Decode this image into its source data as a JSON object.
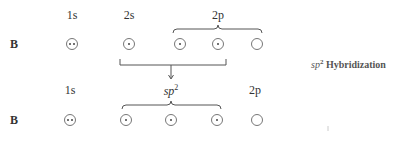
{
  "diagram": {
    "element": "B",
    "top_row": {
      "element_label": "B",
      "labels": {
        "s1": "1s",
        "s2": "2s",
        "p2": "2p"
      },
      "orbitals": [
        {
          "name": "1s",
          "electrons": 2
        },
        {
          "name": "2s",
          "electrons": 1
        },
        {
          "name": "2p_x",
          "electrons": 1
        },
        {
          "name": "2p_y",
          "electrons": 1
        },
        {
          "name": "2p_z",
          "electrons": 0
        }
      ]
    },
    "bottom_row": {
      "element_label": "B",
      "labels": {
        "s1": "1s",
        "sp2": "sp",
        "sp2_sup": "2",
        "p2": "2p"
      },
      "orbitals": [
        {
          "name": "1s",
          "electrons": 2
        },
        {
          "name": "sp2_1",
          "electrons": 1
        },
        {
          "name": "sp2_2",
          "electrons": 1
        },
        {
          "name": "sp2_3",
          "electrons": 1
        },
        {
          "name": "2p",
          "electrons": 0
        }
      ]
    },
    "caption": {
      "prefix": "sp",
      "sup": "2",
      "text": " Hybridization"
    }
  }
}
